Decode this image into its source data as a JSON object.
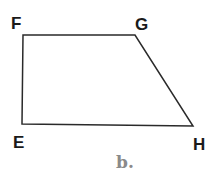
{
  "figure": {
    "shape": "trapezoid",
    "vertices": [
      {
        "label": "F",
        "x": 23,
        "y": 35
      },
      {
        "label": "G",
        "x": 135,
        "y": 35
      },
      {
        "label": "H",
        "x": 193,
        "y": 126
      },
      {
        "label": "E",
        "x": 22,
        "y": 124
      }
    ],
    "labels": {
      "F": "F",
      "G": "G",
      "H": "H",
      "E": "E"
    },
    "caption": "b.",
    "stroke_color": "#2a2a2a",
    "caption_color": "#8a8a8a"
  }
}
